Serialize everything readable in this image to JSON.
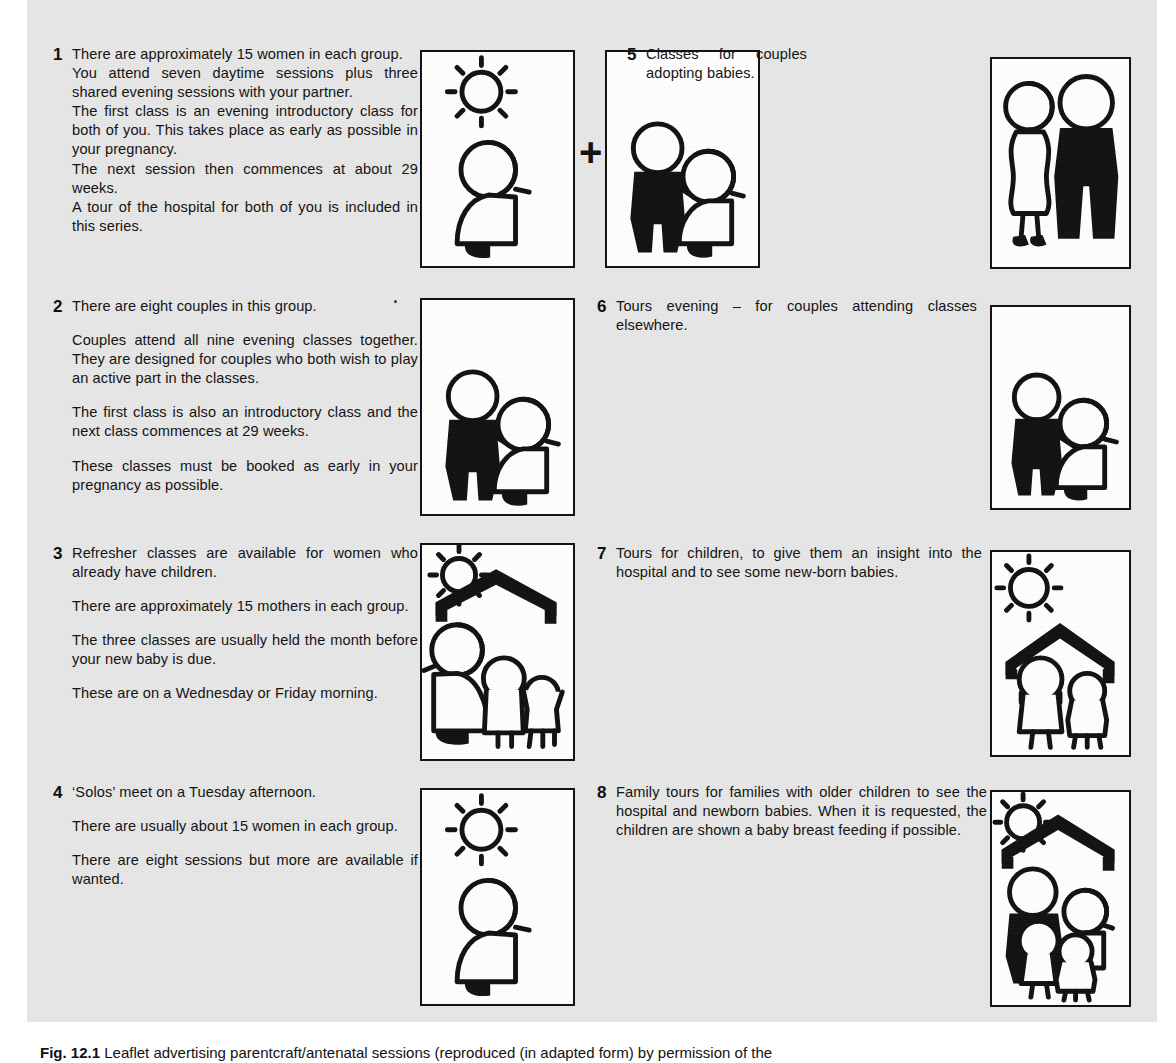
{
  "document": {
    "type": "leaflet-scan",
    "background_color": "#e7e7e7",
    "ink_color": "#111111"
  },
  "items": [
    {
      "number": "1",
      "paragraphs": [
        "There are approximately 15 women in each group.",
        "You attend seven daytime sessions plus three shared evening sessions with your partner.",
        "The first class is an evening introductory class for both of you. This takes place as early as possible in your pregnancy.",
        "The next session then commences at about 29 weeks.",
        "A tour of the hospital for both of you is included in this series."
      ],
      "spacing": "tight",
      "illustration": [
        "sun-pregnant-woman",
        "moon-couple"
      ],
      "connector": "+"
    },
    {
      "number": "2",
      "paragraphs": [
        "There are eight couples in this group.",
        "Couples attend all nine evening classes together. They are designed for couples who both wish to play an active part in the classes.",
        "The first class is also an introductory class and the next class commences at 29 weeks.",
        "These classes must be booked as early in your pregnancy as possible."
      ],
      "spacing": "loose",
      "illustration": [
        "moon-couple"
      ]
    },
    {
      "number": "3",
      "paragraphs": [
        "Refresher classes are available for women who already have children.",
        "There are approximately 15 mothers in each group.",
        "The three classes are usually held the month before your new baby is due.",
        "These are on a Wednesday or Friday morning."
      ],
      "spacing": "loose",
      "illustration": [
        "sun-house-mother-children"
      ]
    },
    {
      "number": "4",
      "paragraphs": [
        "‘Solos’ meet on a Tuesday afternoon.",
        "There are usually about 15 women in each group.",
        "There are eight sessions but more are available if wanted."
      ],
      "spacing": "loose",
      "illustration": [
        "sun-pregnant-woman"
      ]
    },
    {
      "number": "5",
      "paragraphs": [
        "Classes for couples adopting babies."
      ],
      "spacing": "loose",
      "illustration": [
        "couple-standing"
      ]
    },
    {
      "number": "6",
      "paragraphs": [
        "Tours evening – for couples attending classes elsewhere."
      ],
      "spacing": "loose",
      "illustration": [
        "moon-couple"
      ]
    },
    {
      "number": "7",
      "paragraphs": [
        "Tours for children, to give them an insight into the hospital and to see some new-born babies."
      ],
      "spacing": "loose",
      "illustration": [
        "sun-house-two-children"
      ]
    },
    {
      "number": "8",
      "paragraphs": [
        "Family tours for families with older children to see the hospital and newborn babies. When it is requested, the children are shown a baby breast feeding if possible."
      ],
      "spacing": "loose",
      "illustration": [
        "sun-house-family"
      ]
    }
  ],
  "caption": {
    "label": "Fig. 12.1",
    "text": "Leaflet advertising parentcraft/antenatal sessions (reproduced (in adapted form) by permission of the"
  }
}
